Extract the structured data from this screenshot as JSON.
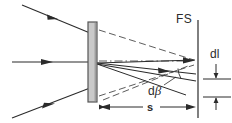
{
  "figure": {
    "name": "grating-dispersion-diagram",
    "background_color": "#ffffff",
    "line_color": "#2b2b2b",
    "grating_fill": "#c9c9c9",
    "grating_edge": "#555555",
    "width_px": 232,
    "height_px": 123
  },
  "labels": {
    "focal_screen": "FS",
    "spot_size": "dl",
    "distance": "s",
    "angle_d": "d",
    "angle_beta": "β"
  },
  "elements": {
    "grating": {
      "name": "diffraction-grating-plate",
      "x": 88,
      "y": 22,
      "width": 9,
      "height": 80
    },
    "screen": {
      "name": "focal-screen-line",
      "x": 198,
      "y_top": 20,
      "y_bottom": 118
    },
    "incoming_rays": [
      {
        "name": "upper-incoming-ray",
        "x1": 22,
        "y1": 5,
        "x2": 90,
        "y2": 33,
        "arrow_t": 0.46
      },
      {
        "name": "center-incoming-ray",
        "x1": 12,
        "y1": 62,
        "x2": 90,
        "y2": 62,
        "arrow_t": 0.45
      },
      {
        "name": "lower-incoming-ray",
        "x1": 12,
        "y1": 118,
        "x2": 90,
        "y2": 88,
        "arrow_t": 0.5
      }
    ],
    "focus_point": {
      "name": "grating-focus-point",
      "x": 97,
      "y": 63
    },
    "diffracted_rays": [
      {
        "name": "diffracted-ray-upper",
        "x1": 97,
        "y1": 63,
        "x2": 196,
        "y2": 61,
        "arrow": true
      },
      {
        "name": "diffracted-ray-middle",
        "x1": 97,
        "y1": 63,
        "x2": 196,
        "y2": 74,
        "arrow": true
      },
      {
        "name": "diffracted-ray-lower",
        "x1": 97,
        "y1": 63,
        "x2": 196,
        "y2": 79,
        "arrow": false
      }
    ],
    "dashed_rays": [
      {
        "name": "dashed-ray-from-grating-top",
        "x1": 98,
        "y1": 30,
        "x2": 196,
        "y2": 61
      },
      {
        "name": "dashed-ray-axis",
        "x1": 98,
        "y1": 61,
        "x2": 196,
        "y2": 61
      },
      {
        "name": "dashed-ray-from-grating-bottom",
        "x1": 98,
        "y1": 95,
        "x2": 196,
        "y2": 64
      }
    ],
    "dimension_s": {
      "name": "distance-s-dimension",
      "x1": 100,
      "x2": 196,
      "y": 107
    },
    "dimension_dl": {
      "name": "spot-size-dl-dimension",
      "x": 216,
      "y_top": 62,
      "y_bottom": 95,
      "tick_left": 203,
      "tick_right": 230
    },
    "angle_marker": {
      "name": "d-beta-angle-arc",
      "vertex_x": 196,
      "vertex_y": 62
    }
  }
}
